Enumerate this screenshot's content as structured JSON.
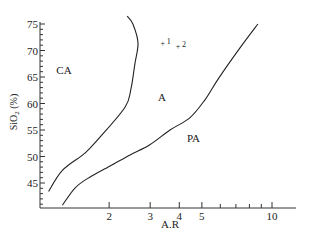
{
  "chart_data": {
    "type": "line",
    "title": "",
    "xlabel": "A.R",
    "ylabel": "SiO2 (%)",
    "x_scale": "log",
    "xlim": [
      1,
      12.5
    ],
    "ylim": [
      40,
      75.5
    ],
    "x_ticks": [
      2,
      3,
      4,
      5,
      10
    ],
    "x_tick_labels": [
      "2",
      "3",
      "4",
      "5",
      "10"
    ],
    "x_minor_ticks": [
      6,
      7,
      8,
      9
    ],
    "y_ticks": [
      45,
      50,
      55,
      60,
      65,
      70,
      75
    ],
    "y_tick_labels": [
      "45",
      "50",
      "55",
      "60",
      "65",
      "70",
      "75"
    ],
    "grid": false,
    "series": [
      {
        "name": "CA-A boundary",
        "x": [
          1.1,
          1.26,
          1.58,
          1.83,
          2.34,
          2.48,
          2.58,
          2.66,
          2.53,
          2.39
        ],
        "y": [
          43.4,
          47.4,
          50.7,
          53.7,
          59.3,
          62.7,
          67.5,
          71.4,
          75.0,
          76.5
        ]
      },
      {
        "name": "A-PA boundary",
        "x": [
          1.26,
          1.43,
          1.65,
          2.02,
          2.46,
          2.99,
          3.65,
          4.44,
          5.16,
          5.87,
          7.29,
          8.7
        ],
        "y": [
          40.8,
          44.1,
          46.1,
          48.2,
          50.3,
          52.2,
          55.0,
          57.3,
          60.7,
          64.6,
          70.5,
          75.0
        ]
      }
    ],
    "region_labels": [
      {
        "text": "CA",
        "x": 1.28,
        "y": 65.5
      },
      {
        "text": "A",
        "x": 3.37,
        "y": 60.5
      },
      {
        "text": "PA",
        "x": 4.6,
        "y": 52.7
      }
    ],
    "points": [
      {
        "label": "1",
        "x": 3.4,
        "y": 71.5
      },
      {
        "label": "2",
        "x": 3.95,
        "y": 70.8
      }
    ]
  }
}
